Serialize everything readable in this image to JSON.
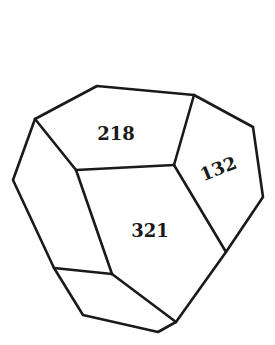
{
  "diagram": {
    "type": "crystal-polyhedron",
    "faces": [
      {
        "id": "face-218",
        "label": "218"
      },
      {
        "id": "face-132",
        "label": "132"
      },
      {
        "id": "face-321",
        "label": "321"
      }
    ],
    "colors": {
      "stroke": "#1a1a1a",
      "background": "#ffffff"
    }
  }
}
